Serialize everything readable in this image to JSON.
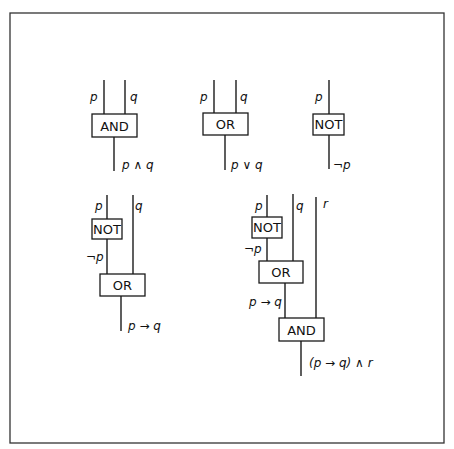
{
  "diagram": {
    "gates": {
      "and": "AND",
      "or": "OR",
      "not": "NOT"
    },
    "basic": {
      "and": {
        "inputs": [
          "p",
          "q"
        ],
        "output": "p ∧ q"
      },
      "or": {
        "inputs": [
          "p",
          "q"
        ],
        "output": "p ∨ q"
      },
      "not": {
        "inputs": [
          "p"
        ],
        "output": "¬p"
      }
    },
    "implication": {
      "inputs": [
        "p",
        "q"
      ],
      "intermediate": "¬p",
      "output": "p → q"
    },
    "compound": {
      "inputs": [
        "p",
        "q",
        "r"
      ],
      "intermediate_not": "¬p",
      "intermediate_or": "p → q",
      "output": "(p → q) ∧ r"
    }
  }
}
